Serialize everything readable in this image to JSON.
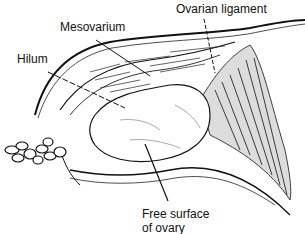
{
  "diagram": {
    "labels": {
      "ovarian_ligament": "Ovarian ligament",
      "mesovarium": "Mesovarium",
      "hilum": "Hilum",
      "free_surface_line1": "Free surface",
      "free_surface_line2": "of ovary"
    }
  }
}
